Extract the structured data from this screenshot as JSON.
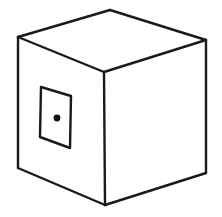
{
  "figure": {
    "title": "Cube with square panel and centered dot",
    "subject": "cube",
    "style": "black line drawing on white background",
    "background_color": "#ffffff",
    "line_color": "#1a1a1a",
    "fill_color": "#ffffff",
    "dot_color": "#111111"
  },
  "geometry": {
    "canvas": {
      "width": 222,
      "height": 217
    },
    "cube": {
      "label": "cube-outline",
      "vertices": {
        "top_back": [
          110,
          10
        ],
        "top_left": [
          18,
          37
        ],
        "top_right": [
          206,
          40
        ],
        "top_front": [
          104,
          72
        ],
        "bottom_left": [
          18,
          168
        ],
        "bottom_front": [
          105,
          205
        ],
        "bottom_right": [
          206,
          173
        ]
      },
      "faces": [
        {
          "name": "top-face",
          "points": "110,10 18,37 104,72 206,40"
        },
        {
          "name": "left-face",
          "points": "18,37 18,168 105,205 104,72"
        },
        {
          "name": "right-face",
          "points": "104,72 105,205 206,173 206,40"
        }
      ],
      "edges": [
        {
          "name": "edge-top-back-left",
          "points": "110,10 18,37"
        },
        {
          "name": "edge-top-back-right",
          "points": "110,10 206,40"
        },
        {
          "name": "edge-top-front-left",
          "points": "18,37 104,72"
        },
        {
          "name": "edge-top-front-right",
          "points": "104,72 206,40"
        },
        {
          "name": "edge-vertical-left",
          "points": "18,37 18,168"
        },
        {
          "name": "edge-vertical-center",
          "points": "104,72 105,205"
        },
        {
          "name": "edge-vertical-right",
          "points": "206,40 206,173"
        },
        {
          "name": "edge-bottom-left",
          "points": "18,168 105,205"
        },
        {
          "name": "edge-bottom-right",
          "points": "105,205 206,173"
        }
      ],
      "stroke_width": 2.4
    },
    "panel": {
      "label": "square-panel",
      "points": "41,87 71,96 70,148 40,137",
      "stroke_width": 2.4
    },
    "dot": {
      "label": "center-dot",
      "cx": 57,
      "cy": 118,
      "r": 3.4
    }
  }
}
